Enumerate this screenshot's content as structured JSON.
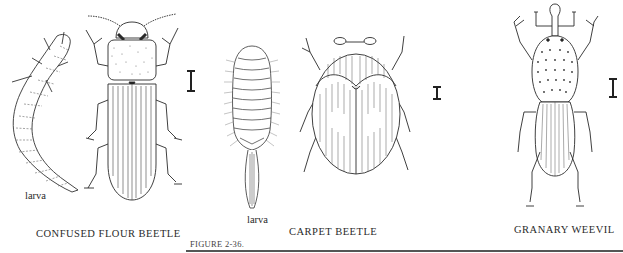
{
  "figure": {
    "label": "FIGURE 2-36.",
    "panels": [
      {
        "id": "confused-flour-beetle",
        "caption": "CONFUSED FLOUR BEETLE",
        "larva_label": "larva",
        "scale_bar": "I"
      },
      {
        "id": "carpet-beetle",
        "caption": "CARPET BEETLE",
        "larva_label": "larva",
        "scale_bar": "I"
      },
      {
        "id": "granary-weevil",
        "caption": "GRANARY WEEVIL",
        "scale_bar": "I"
      }
    ]
  }
}
